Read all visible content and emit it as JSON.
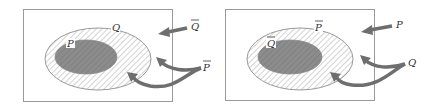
{
  "colors": {
    "frame": "#9a9a9a",
    "ellipse_stroke": "#9a9a9a",
    "hatch": "#b5b5b5",
    "inner_fill": "#8a8a8a",
    "arrow": "#6e6e6e",
    "label": "#333333"
  },
  "panels": [
    {
      "name": "left",
      "outer_set": {
        "label": "Q",
        "overbar": false
      },
      "inner_set": {
        "label": "P",
        "overbar": false
      },
      "top_arrow_label": {
        "label": "Q",
        "overbar": true
      },
      "fork_arrow_label": {
        "label": "P",
        "overbar": true
      }
    },
    {
      "name": "right",
      "outer_set": {
        "label": "P",
        "overbar": true
      },
      "inner_set": {
        "label": "Q",
        "overbar": true
      },
      "top_arrow_label": {
        "label": "P",
        "overbar": false
      },
      "fork_arrow_label": {
        "label": "Q",
        "overbar": false
      }
    }
  ]
}
